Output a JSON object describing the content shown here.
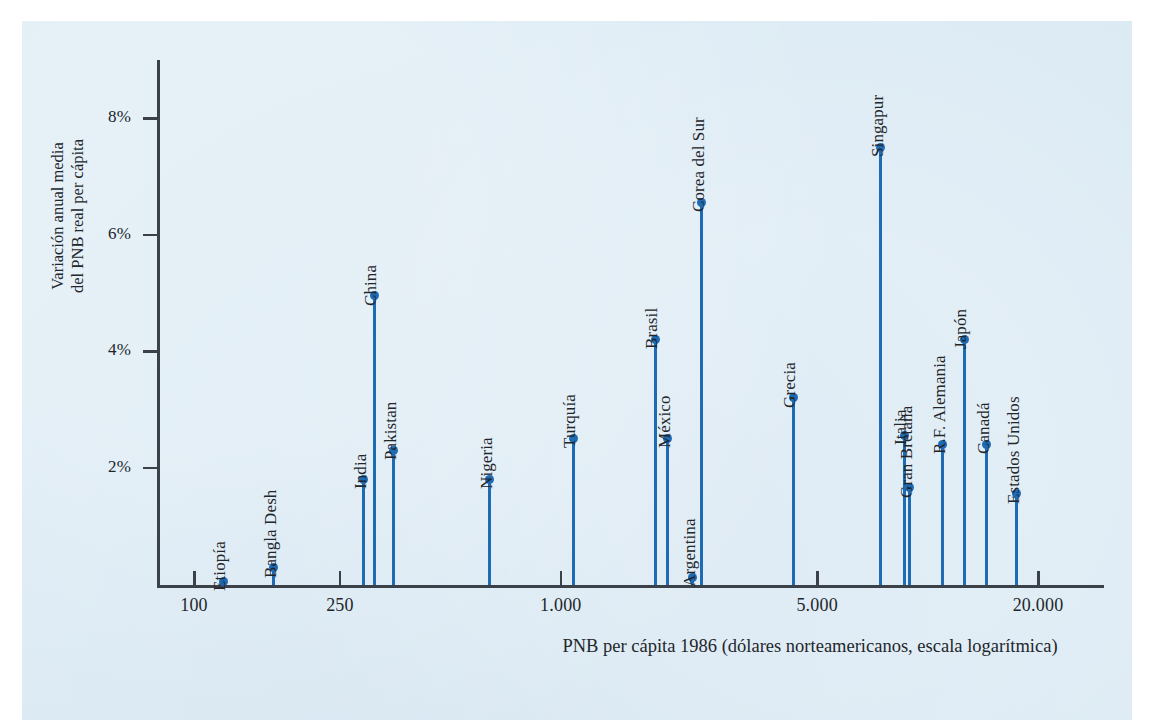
{
  "chart_data": {
    "type": "scatter",
    "title": "",
    "xlabel": "PNB per cápita 1986 (dólares\nnorteamericanos, escala logarítmica)",
    "ylabel": "Variación anual media\ndel PNB real per cápita",
    "xscale": "log",
    "xlim": [
      85,
      26000
    ],
    "ylim": [
      0,
      9
    ],
    "grid": false,
    "legend": false,
    "x_tick_labels": [
      "100",
      "250",
      "1.000",
      "5.000",
      "20.000"
    ],
    "x_tick_values": [
      100,
      250,
      1000,
      5000,
      20000
    ],
    "y_tick_labels": [
      "2%",
      "4%",
      "6%",
      "8%"
    ],
    "y_tick_values": [
      2,
      4,
      6,
      8
    ],
    "points": [
      {
        "label": "Etiopía",
        "x": 120,
        "y": 0.05
      },
      {
        "label": "Bangla Desh",
        "x": 165,
        "y": 0.28
      },
      {
        "label": "India",
        "x": 290,
        "y": 1.8
      },
      {
        "label": "China",
        "x": 310,
        "y": 4.95
      },
      {
        "label": "Pakistan",
        "x": 350,
        "y": 2.3
      },
      {
        "label": "Nigeria",
        "x": 640,
        "y": 1.8
      },
      {
        "label": "Turquía",
        "x": 1080,
        "y": 2.5
      },
      {
        "label": "Brasil",
        "x": 1810,
        "y": 4.2
      },
      {
        "label": "México",
        "x": 1960,
        "y": 2.5
      },
      {
        "label": "Argentina",
        "x": 2290,
        "y": 0.12
      },
      {
        "label": "Corea del Sur",
        "x": 2420,
        "y": 6.55
      },
      {
        "label": "Grecia",
        "x": 4300,
        "y": 3.2
      },
      {
        "label": "Singapur",
        "x": 7450,
        "y": 7.5
      },
      {
        "label": "Italia",
        "x": 8650,
        "y": 2.55
      },
      {
        "label": "Gran Bretaña",
        "x": 8950,
        "y": 1.65
      },
      {
        "label": "R.F. Alemania",
        "x": 11000,
        "y": 2.4
      },
      {
        "label": "Japón",
        "x": 12600,
        "y": 4.2
      },
      {
        "label": "Canadá",
        "x": 14500,
        "y": 2.4
      },
      {
        "label": "Estados Unidos",
        "x": 17500,
        "y": 1.55
      }
    ]
  },
  "style": {
    "panel_color": "#dbeaf4",
    "accent_color": "#1d6ab5",
    "axis_color": "#3b4149",
    "text_color": "#22262b"
  }
}
